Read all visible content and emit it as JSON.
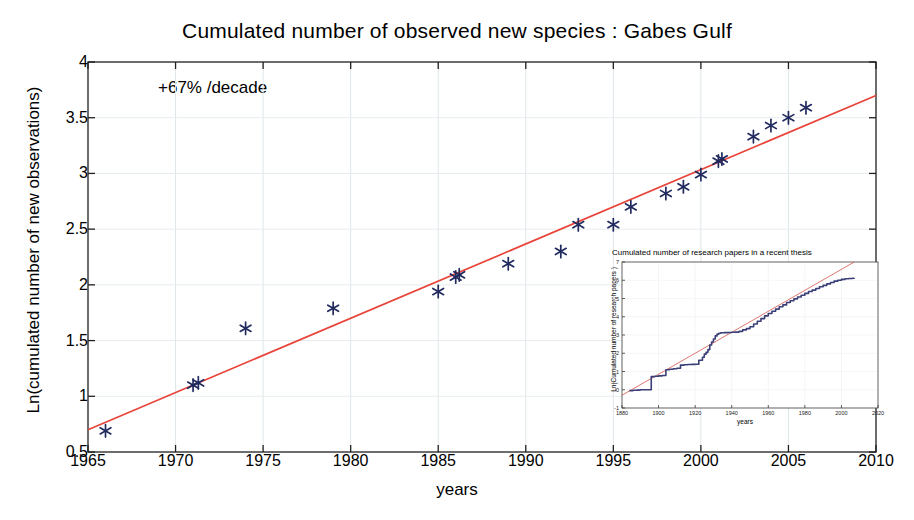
{
  "chart_data": {
    "type": "scatter",
    "title": "Cumulated number of observed new species : Gabes Gulf",
    "xlabel": "years",
    "ylabel": "Ln(cumulated number of new observations)",
    "xlim": [
      1965,
      2010
    ],
    "ylim": [
      0.5,
      4
    ],
    "xticks": [
      "1965",
      "1970",
      "1975",
      "1980",
      "1985",
      "1990",
      "1995",
      "2000",
      "2005",
      "2010"
    ],
    "xtick_values": [
      1965,
      1970,
      1975,
      1980,
      1985,
      1990,
      1995,
      2000,
      2005,
      2010
    ],
    "yticks": [
      "0.5",
      "1",
      "1.5",
      "2",
      "2.5",
      "3",
      "3.5",
      "4"
    ],
    "ytick_values": [
      0.5,
      1,
      1.5,
      2,
      2.5,
      3,
      3.5,
      4
    ],
    "grid": true,
    "legend": "none",
    "annotation": "+67% /decade",
    "marker": "asterisk",
    "marker_color": "#202a5e",
    "line_color": "#e8443a",
    "series": [
      {
        "name": "observed new species",
        "x": [
          1966,
          1971,
          1971.3,
          1974,
          1979,
          1985,
          1986,
          1986.2,
          1989,
          1992,
          1993,
          1995,
          1996,
          1998,
          1999,
          2000,
          2001,
          2001.2,
          2003,
          2004,
          2005,
          2006
        ],
        "y": [
          0.69,
          1.1,
          1.12,
          1.61,
          1.79,
          1.94,
          2.07,
          2.09,
          2.19,
          2.3,
          2.54,
          2.54,
          2.7,
          2.82,
          2.88,
          2.99,
          3.11,
          3.13,
          3.33,
          3.43,
          3.5,
          3.59
        ]
      }
    ],
    "trendline": {
      "name": "fit +67% per decade",
      "x": [
        1965,
        2010
      ],
      "y": [
        0.7,
        3.7
      ],
      "color": "#e8443a"
    }
  },
  "inset_chart_data": {
    "type": "line",
    "title": "Cumulated number of research papers in a recent thesis",
    "xlabel": "years",
    "ylabel": "Ln(Cumulated number of research papers )",
    "annotation": "+52% /decade",
    "xlim": [
      1880,
      2020
    ],
    "ylim": [
      -1,
      7
    ],
    "xticks": [
      "1880",
      "1900",
      "1920",
      "1940",
      "1960",
      "1980",
      "2000",
      "2020"
    ],
    "xtick_values": [
      1880,
      1900,
      1920,
      1940,
      1960,
      1980,
      2000,
      2020
    ],
    "yticks": [
      "7",
      "6",
      "5",
      "4",
      "3",
      "2",
      "1",
      "0",
      "-1"
    ],
    "ytick_values": [
      7,
      6,
      5,
      4,
      3,
      2,
      1,
      0,
      -1
    ],
    "grid": true,
    "marker_color": "#3b3f77",
    "line_color": "#d4564a",
    "series": [
      {
        "name": "cumulated research papers",
        "x": [
          1884,
          1886,
          1888,
          1890,
          1892,
          1894,
          1896,
          1898,
          1900,
          1902,
          1904,
          1906,
          1908,
          1910,
          1912,
          1914,
          1916,
          1918,
          1920,
          1922,
          1924,
          1925,
          1926,
          1927,
          1928,
          1929,
          1930,
          1931,
          1932,
          1933,
          1934,
          1936,
          1938,
          1940,
          1942,
          1944,
          1946,
          1948,
          1950,
          1952,
          1954,
          1956,
          1958,
          1960,
          1962,
          1964,
          1966,
          1968,
          1970,
          1972,
          1974,
          1976,
          1978,
          1980,
          1982,
          1984,
          1986,
          1988,
          1990,
          1992,
          1994,
          1996,
          1998,
          2000,
          2002,
          2004,
          2006,
          2007
        ],
        "y": [
          -0.05,
          -0.03,
          -0.02,
          0.0,
          0.0,
          0.0,
          0.72,
          0.74,
          0.76,
          0.78,
          1.1,
          1.12,
          1.15,
          1.18,
          1.35,
          1.37,
          1.38,
          1.39,
          1.4,
          1.62,
          1.78,
          1.95,
          2.05,
          2.2,
          2.45,
          2.62,
          2.78,
          2.95,
          3.05,
          3.1,
          3.12,
          3.13,
          3.14,
          3.15,
          3.16,
          3.2,
          3.28,
          3.35,
          3.45,
          3.6,
          3.75,
          3.9,
          4.05,
          4.18,
          4.3,
          4.42,
          4.55,
          4.65,
          4.78,
          4.88,
          4.98,
          5.08,
          5.18,
          5.28,
          5.38,
          5.46,
          5.55,
          5.64,
          5.72,
          5.8,
          5.88,
          5.95,
          6.0,
          6.05,
          6.08,
          6.1,
          6.11,
          6.12
        ]
      }
    ],
    "trendline": {
      "name": "fit +52% per decade",
      "x": [
        1880,
        2007
      ],
      "y": [
        -0.3,
        7.0
      ],
      "color": "#d4564a"
    }
  }
}
